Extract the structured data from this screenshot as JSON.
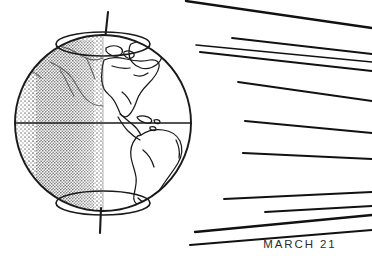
{
  "figure": {
    "background_color": "#ffffff",
    "ink_color": "#1a1a1a",
    "caption": {
      "text": "MARCH 21",
      "x": 300,
      "y": 248
    }
  },
  "globe": {
    "label": "earth-globe",
    "center_x": 103,
    "center_y": 123,
    "radius": 89,
    "outline_color": "#1a1a1a",
    "outline_width": 1.9,
    "day_side": "right",
    "night_side": "left",
    "night_fill": "#b9b9b9",
    "day_fill": "#ffffff",
    "terminator": {
      "label": "day-night-terminator",
      "x": 103,
      "note": "vertical straight line at equinox"
    },
    "equator": {
      "label": "equator-line",
      "y": 123,
      "x1": 14,
      "x2": 192
    },
    "axis": {
      "label": "rotation-axis",
      "top_x": 108,
      "top_y": 12,
      "bottom_x": 100,
      "bottom_y": 233,
      "tilt_degrees": 23.5
    },
    "arctic_circle": {
      "label": "arctic-circle",
      "cx": 103,
      "cy": 44,
      "rx": 47,
      "ry": 12
    },
    "antarctic_circle": {
      "label": "antarctic-circle",
      "cx": 103,
      "cy": 203,
      "rx": 47,
      "ry": 12
    },
    "landmasses": [
      "greenland",
      "north-america",
      "central-america",
      "caribbean-islands",
      "south-america",
      "northeast-asia-faint"
    ]
  },
  "sun_rays": {
    "label": "parallel-sun-rays",
    "count": 11,
    "direction": "from upper right toward earth",
    "color": "#111111",
    "lines": [
      {
        "x1": 372,
        "y1": 28,
        "x2": 186,
        "y2": 1,
        "w": 2.4
      },
      {
        "x1": 372,
        "y1": 54,
        "x2": 232,
        "y2": 38,
        "w": 1.9
      },
      {
        "x1": 372,
        "y1": 62,
        "x2": 196,
        "y2": 45,
        "w": 1.6
      },
      {
        "x1": 372,
        "y1": 71,
        "x2": 200,
        "y2": 52,
        "w": 2.0
      },
      {
        "x1": 372,
        "y1": 101,
        "x2": 238,
        "y2": 82,
        "w": 1.8
      },
      {
        "x1": 372,
        "y1": 133,
        "x2": 245,
        "y2": 121,
        "w": 2.0
      },
      {
        "x1": 372,
        "y1": 159,
        "x2": 243,
        "y2": 153,
        "w": 2.2
      },
      {
        "x1": 372,
        "y1": 192,
        "x2": 224,
        "y2": 199,
        "w": 1.9
      },
      {
        "x1": 372,
        "y1": 206,
        "x2": 265,
        "y2": 212,
        "w": 1.8
      },
      {
        "x1": 372,
        "y1": 215,
        "x2": 195,
        "y2": 232,
        "w": 2.3
      },
      {
        "x1": 372,
        "y1": 230,
        "x2": 190,
        "y2": 245,
        "w": 2.1
      }
    ]
  }
}
